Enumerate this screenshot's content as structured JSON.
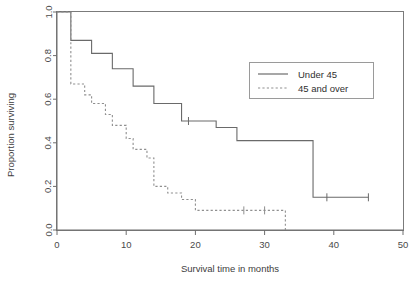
{
  "chart_data": {
    "type": "line",
    "title": "",
    "subtitle": "",
    "xlabel": "Survival time in months",
    "ylabel": "Proportion surviving",
    "xlim": [
      0,
      50
    ],
    "ylim": [
      0,
      1
    ],
    "xticks": [
      0,
      10,
      20,
      30,
      40,
      50
    ],
    "xtick_labels": [
      "0",
      "10",
      "20",
      "30",
      "40",
      "50"
    ],
    "yticks": [
      0.0,
      0.2,
      0.4,
      0.6,
      0.8,
      1.0
    ],
    "ytick_labels": [
      "0.0",
      "0.2",
      "0.4",
      "0.6",
      "0.8",
      "1.0"
    ],
    "grid": false,
    "legend_position": "upper right",
    "plot_style": "kaplan-meier step curves",
    "series": [
      {
        "name": "Under 45",
        "linestyle": "solid",
        "color": "#6a6a6a",
        "x": [
          0,
          2,
          2,
          4,
          5,
          8,
          11,
          12,
          14,
          18,
          23,
          26,
          31,
          37,
          45
        ],
        "y": [
          1.0,
          1.0,
          0.87,
          0.87,
          0.81,
          0.81,
          0.74,
          0.66,
          0.66,
          0.5,
          0.47,
          0.41,
          0.41,
          0.15,
          0.15
        ],
        "steps": [
          {
            "time": 0,
            "survival": 1.0
          },
          {
            "time": 2,
            "survival": 0.87
          },
          {
            "time": 5,
            "survival": 0.81
          },
          {
            "time": 8,
            "survival": 0.74
          },
          {
            "time": 11,
            "survival": 0.66
          },
          {
            "time": 14,
            "survival": 0.58
          },
          {
            "time": 18,
            "survival": 0.5
          },
          {
            "time": 23,
            "survival": 0.47
          },
          {
            "time": 26,
            "survival": 0.41
          },
          {
            "time": 31,
            "survival": 0.41
          },
          {
            "time": 37,
            "survival": 0.15
          },
          {
            "time": 45,
            "survival": 0.15
          }
        ],
        "censored": [
          19,
          39,
          45
        ]
      },
      {
        "name": "45 and over",
        "linestyle": "dashed",
        "color": "#8f8f8f",
        "steps": [
          {
            "time": 0,
            "survival": 1.0
          },
          {
            "time": 2,
            "survival": 0.67
          },
          {
            "time": 4,
            "survival": 0.62
          },
          {
            "time": 5,
            "survival": 0.58
          },
          {
            "time": 7,
            "survival": 0.53
          },
          {
            "time": 8,
            "survival": 0.48
          },
          {
            "time": 10,
            "survival": 0.42
          },
          {
            "time": 11,
            "survival": 0.37
          },
          {
            "time": 13,
            "survival": 0.33
          },
          {
            "time": 14,
            "survival": 0.2
          },
          {
            "time": 16,
            "survival": 0.17
          },
          {
            "time": 18,
            "survival": 0.14
          },
          {
            "time": 20,
            "survival": 0.09
          },
          {
            "time": 33,
            "survival": 0.09
          },
          {
            "time": 33,
            "survival": 0.0
          }
        ],
        "censored": [
          27,
          30
        ]
      }
    ],
    "annotations": [
      {
        "text": "censoring ticks shown as small vertical marks on curves"
      }
    ]
  },
  "legend": {
    "entries": [
      {
        "label": "Under 45",
        "style": "solid"
      },
      {
        "label": "45 and over",
        "style": "dashed"
      }
    ]
  }
}
